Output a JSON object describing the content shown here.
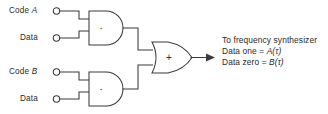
{
  "diagram": {
    "type": "logic-circuit-schematic",
    "background_color": "#ffffff",
    "line_color": "#3a3a3a",
    "text_color": "#2b2b2b",
    "inputs": [
      {
        "id": "code-a",
        "label": "Code A",
        "label_plain": "Code",
        "label_italic": "A",
        "terminal": "open-circle"
      },
      {
        "id": "data-1",
        "label": "Data",
        "label_plain": "Data",
        "label_italic": "",
        "terminal": "open-circle"
      },
      {
        "id": "code-b",
        "label": "Code B",
        "label_plain": "Code",
        "label_italic": "B",
        "terminal": "open-circle"
      },
      {
        "id": "data-2",
        "label": "Data",
        "label_plain": "Data",
        "label_italic": "",
        "terminal": "open-circle"
      }
    ],
    "gates": [
      {
        "id": "and-gate-top",
        "kind": "AND",
        "symbol": "·",
        "inputs": [
          "code-a",
          "data-1"
        ]
      },
      {
        "id": "and-gate-bottom",
        "kind": "AND",
        "symbol": "·",
        "inputs": [
          "code-b",
          "data-2"
        ]
      },
      {
        "id": "or-gate",
        "kind": "OR",
        "symbol": "+",
        "inputs": [
          "and-gate-top",
          "and-gate-bottom"
        ]
      }
    ],
    "output": {
      "id": "synthesizer-output",
      "arrow": true,
      "annotation_lines": [
        {
          "id": "line-1",
          "text": "To frequency synthesizer",
          "prefix": "To frequency synthesizer",
          "italic": "",
          "suffix": ""
        },
        {
          "id": "line-2",
          "text": "Data one = A(τ)",
          "prefix": "Data one = ",
          "italic": "A(τ)",
          "suffix": ""
        },
        {
          "id": "line-3",
          "text": "Data zero = B(τ)",
          "prefix": "Data zero = ",
          "italic": "B(τ)",
          "suffix": ""
        }
      ]
    }
  }
}
